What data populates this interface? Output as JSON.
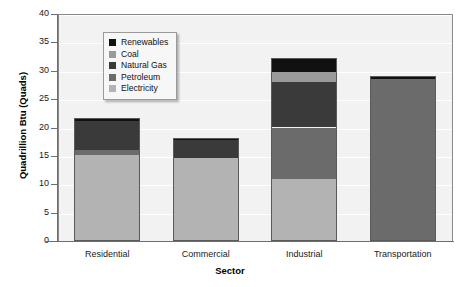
{
  "chart_data": {
    "type": "bar",
    "subtype": "stacked-bar",
    "title": "",
    "xlabel": "Sector",
    "ylabel": "Quadrillion Btu (Quads)",
    "ylim": [
      0,
      40
    ],
    "yticks": [
      0,
      5,
      10,
      15,
      20,
      25,
      30,
      35,
      40
    ],
    "grid": true,
    "legend_position": "upper-left-inside",
    "categories": [
      "Residential",
      "Commercial",
      "Industrial",
      "Transportation"
    ],
    "series": [
      {
        "name": "Electricity",
        "color": "#b3b3b3",
        "values": [
          15.1,
          14.6,
          11.0,
          0.0
        ]
      },
      {
        "name": "Petroleum",
        "color": "#6b6b6b",
        "values": [
          0.9,
          0.0,
          9.0,
          28.5
        ]
      },
      {
        "name": "Natural Gas",
        "color": "#3a3a3a",
        "values": [
          5.1,
          3.2,
          8.1,
          0.0
        ]
      },
      {
        "name": "Coal",
        "color": "#9a9a9a",
        "values": [
          0.0,
          0.0,
          1.6,
          0.0
        ]
      },
      {
        "name": "Renewables",
        "color": "#111111",
        "values": [
          0.5,
          0.4,
          2.6,
          0.5
        ]
      }
    ],
    "totals": [
      21.6,
      18.2,
      32.3,
      29.0
    ]
  },
  "legend": {
    "items": [
      {
        "label": "Renewables",
        "color": "#111111"
      },
      {
        "label": "Coal",
        "color": "#9a9a9a"
      },
      {
        "label": "Natural Gas",
        "color": "#3a3a3a"
      },
      {
        "label": "Petroleum",
        "color": "#6b6b6b"
      },
      {
        "label": "Electricity",
        "color": "#b3b3b3"
      }
    ]
  },
  "axes": {
    "y_title": "Quadrillion Btu (Quads)",
    "x_title": "Sector",
    "y_tick_labels": [
      "40",
      "35",
      "30",
      "25",
      "20",
      "15",
      "10",
      "5",
      "0"
    ],
    "x_tick_labels": [
      "Residential",
      "Commercial",
      "Industrial",
      "Transportation"
    ]
  },
  "style": {
    "plot_background": "#f2f2f2",
    "grid_color": "#ffffff",
    "axis_color": "#6e6e6e",
    "page_background": "#ffffff"
  }
}
